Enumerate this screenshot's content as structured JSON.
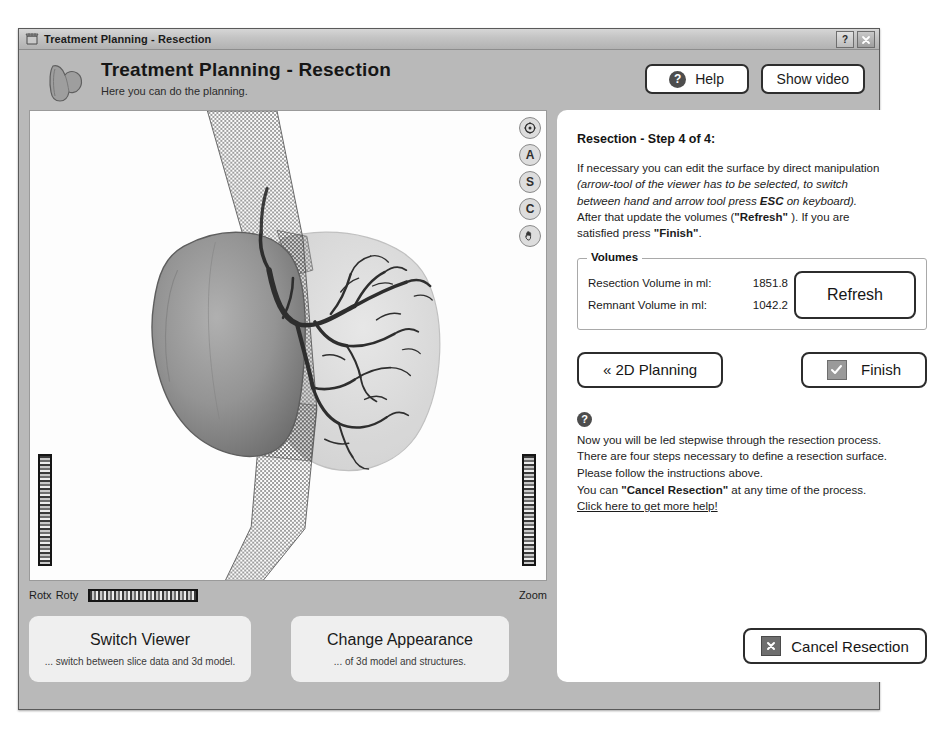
{
  "window": {
    "title": "Treatment Planning - Resection",
    "icon": "application-icon",
    "help_button": "?",
    "close_button": "x"
  },
  "header": {
    "title": "Treatment Planning - Resection",
    "subtitle": "Here you can do the planning.",
    "icon": "liver-organ-icon",
    "help_label": "Help",
    "help_icon": "question-mark-icon",
    "show_video_label": "Show video"
  },
  "viewer": {
    "tools": [
      {
        "name": "reset-view-icon",
        "label": ""
      },
      {
        "name": "axial-view-icon",
        "label": "A"
      },
      {
        "name": "sagittal-view-icon",
        "label": "S"
      },
      {
        "name": "coronal-view-icon",
        "label": "C"
      },
      {
        "name": "hand-tool-icon",
        "label": ""
      }
    ],
    "rotx_label": "Rotx",
    "roty_label": "Roty",
    "zoom_label": "Zoom",
    "scene": {
      "description": "3D liver model with resection surface",
      "resection_volume_color": "#8f8f8f",
      "remnant_volume_color": "#d8d8d8",
      "vessel_color": "#3a3a3a",
      "resection_surface_color": "#555555"
    }
  },
  "bottom_cards": [
    {
      "title": "Switch Viewer",
      "subtitle": "... switch between slice data and 3d model."
    },
    {
      "title": "Change Appearance",
      "subtitle": "... of 3d model and structures."
    }
  ],
  "panel": {
    "step_title": "Resection - Step 4 of 4:",
    "instruction": {
      "line1": "If necessary you can edit the surface by direct manipulation",
      "italic1": "(arrow-tool of the viewer has to be selected, to switch",
      "italic2": "between hand and arrow tool press ",
      "italic_bold": "ESC",
      "italic3": " on keyboard).",
      "line2_a": "After that update the volumes (",
      "line2_bold": "\"Refresh\"",
      "line2_b": " ). If you are",
      "line3_a": "satisfied press ",
      "line3_bold": "\"Finish\"",
      "line3_b": "."
    },
    "volumes": {
      "legend": "Volumes",
      "rows": [
        {
          "label": "Resection Volume in ml:",
          "value": "1851.8"
        },
        {
          "label": "Remnant Volume in ml:",
          "value": "1042.2"
        }
      ],
      "refresh_label": "Refresh"
    },
    "back_label": "« 2D Planning",
    "finish_label": "Finish",
    "finish_checkbox_icon": "checkmark-icon",
    "help": {
      "icon": "question-mark-icon",
      "line1": "Now you will be led stepwise through the resection process.",
      "line2": "There are four steps necessary to define a resection surface.",
      "line3": "Please follow the instructions above.",
      "line4_a": "You can ",
      "line4_bold": "\"Cancel Resection\"",
      "line4_b": " at any time of the process.",
      "link": "Click here to get more help!"
    },
    "cancel_label": "Cancel Resection",
    "cancel_icon": "x-icon"
  }
}
